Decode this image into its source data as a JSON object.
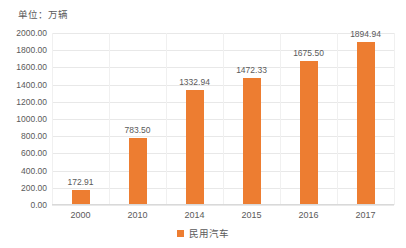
{
  "unit_caption": "单位：万辆",
  "legend": {
    "items": [
      {
        "label": "民用汽车",
        "color": "#ed7d31",
        "marker": "square-swatch"
      }
    ]
  },
  "colors": {
    "bar": "#ed7d31",
    "gridline": "#e8e8e8",
    "text": "#5a5a5a",
    "background": "#ffffff"
  },
  "chart_data": {
    "type": "bar",
    "title": "单位：万辆",
    "xlabel": "",
    "ylabel": "",
    "categories": [
      "2000",
      "2010",
      "2014",
      "2015",
      "2016",
      "2017"
    ],
    "series": [
      {
        "name": "民用汽车",
        "color": "#ed7d31",
        "values": [
          172.91,
          783.5,
          1332.94,
          1472.33,
          1675.5,
          1894.94
        ]
      }
    ],
    "value_labels": [
      "172.91",
      "783.50",
      "1332.94",
      "1472.33",
      "1675.50",
      "1894.94"
    ],
    "ylim": [
      0,
      2000
    ],
    "ytick_values": [
      0,
      200,
      400,
      600,
      800,
      1000,
      1200,
      1400,
      1600,
      1800,
      2000
    ],
    "ytick_labels": [
      "0.00",
      "200.00",
      "400.00",
      "600.00",
      "800.00",
      "1000.00",
      "1200.00",
      "1400.00",
      "1600.00",
      "1800.00",
      "2000.00"
    ],
    "grid": {
      "horizontal": true,
      "vertical": true
    },
    "legend_position": "bottom-center"
  }
}
